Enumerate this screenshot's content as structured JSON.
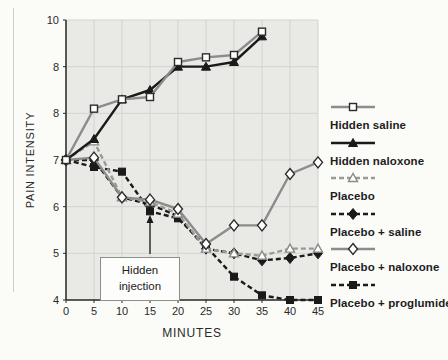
{
  "chart_data": {
    "type": "line",
    "title": "",
    "xlabel": "MINUTES",
    "ylabel": "PAIN INTENSITY",
    "xlim": [
      0,
      45
    ],
    "ylim": [
      4,
      10
    ],
    "x_ticks": [
      0,
      5,
      10,
      15,
      20,
      25,
      30,
      35,
      40,
      45
    ],
    "y_ticks": [
      {
        "value": 10,
        "label": "10"
      },
      {
        "value": 9,
        "label": "8"
      },
      {
        "value": 8,
        "label": "8"
      },
      {
        "value": 7,
        "label": "7"
      },
      {
        "value": 6,
        "label": "6"
      },
      {
        "value": 5,
        "label": "5"
      },
      {
        "value": 4,
        "label": "4"
      }
    ],
    "grid": true,
    "plot_bg": "#e9e9e6",
    "grid_color": "#d3d3cf",
    "axis_color": "#2a2a2a",
    "legend_position": "right",
    "annotation": {
      "text": "Hidden injection",
      "target_x": 15
    },
    "series": [
      {
        "name": "Hidden saline",
        "color": "#8c8c8c",
        "line": "solid",
        "marker": "open-square",
        "marker_stroke": "#2b2b2b",
        "x": [
          0,
          5,
          10,
          15,
          20,
          25,
          30,
          35
        ],
        "values": [
          7.0,
          8.1,
          8.3,
          8.35,
          9.1,
          9.2,
          9.25,
          9.75
        ]
      },
      {
        "name": "Hidden naloxone",
        "color": "#1a1a1a",
        "line": "solid",
        "marker": "filled-triangle",
        "marker_stroke": "#1a1a1a",
        "x": [
          0,
          5,
          10,
          15,
          20,
          25,
          30,
          35
        ],
        "values": [
          7.0,
          7.45,
          8.3,
          8.5,
          9.0,
          9.0,
          9.1,
          9.65
        ]
      },
      {
        "name": "Placebo",
        "color": "#9a9a97",
        "line": "dashed",
        "marker": "open-triangle",
        "marker_stroke": "#8a8a86",
        "x": [
          0,
          5,
          10,
          15,
          20,
          25,
          30,
          35,
          40,
          45
        ],
        "values": [
          7.0,
          7.4,
          6.2,
          6.1,
          5.85,
          5.1,
          5.0,
          4.95,
          5.1,
          5.1
        ]
      },
      {
        "name": "Placebo + saline",
        "color": "#1a1a1a",
        "line": "dashed",
        "marker": "filled-diamond",
        "marker_stroke": "#1a1a1a",
        "x": [
          0,
          5,
          10,
          15,
          20,
          25,
          30,
          35,
          40,
          45
        ],
        "values": [
          7.0,
          7.0,
          6.2,
          6.05,
          5.8,
          5.1,
          5.0,
          4.85,
          4.9,
          5.0
        ]
      },
      {
        "name": "Placebo + naloxone",
        "color": "#8c8c8c",
        "line": "solid",
        "marker": "open-diamond",
        "marker_stroke": "#2b2b2b",
        "x": [
          0,
          5,
          10,
          15,
          20,
          25,
          30,
          35,
          40,
          45
        ],
        "values": [
          7.0,
          7.05,
          6.2,
          6.15,
          5.95,
          5.2,
          5.6,
          5.6,
          6.7,
          6.95
        ]
      },
      {
        "name": "Placebo + proglumide",
        "color": "#1a1a1a",
        "line": "dashed",
        "marker": "filled-square",
        "marker_stroke": "#1a1a1a",
        "x": [
          0,
          5,
          10,
          15,
          20,
          25,
          30,
          35,
          40,
          45
        ],
        "values": [
          7.0,
          6.85,
          6.75,
          5.9,
          5.75,
          5.15,
          4.5,
          4.1,
          4.0,
          4.0
        ]
      }
    ]
  }
}
